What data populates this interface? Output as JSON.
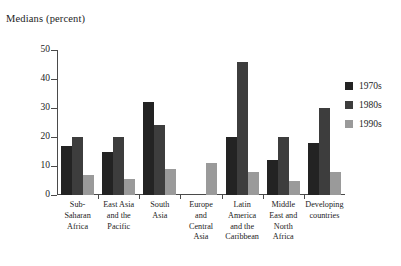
{
  "chart_data": {
    "type": "bar",
    "title": "Medians (percent)",
    "xlabel": "",
    "ylabel": "",
    "ylim": [
      0,
      50
    ],
    "yticks": [
      0,
      10,
      20,
      30,
      40,
      50
    ],
    "grid": false,
    "legend_position": "right",
    "categories": [
      "Sub-Saharan Africa",
      "East Asia and the Pacific",
      "South Asia",
      "Europe and Central Asia",
      "Latin America and the Caribbean",
      "Middle East and North Africa",
      "Developing countries"
    ],
    "category_label_lines": [
      [
        "Sub-",
        "Saharan",
        "Africa"
      ],
      [
        "East Asia",
        "and the",
        "Pacific"
      ],
      [
        "South",
        "Asia"
      ],
      [
        "Europe",
        "and",
        "Central",
        "Asia"
      ],
      [
        "Latin",
        "America",
        "and the",
        "Caribbean"
      ],
      [
        "Middle",
        "East and",
        "North",
        "Africa"
      ],
      [
        "Developing",
        "countries"
      ]
    ],
    "series": [
      {
        "name": "1970s",
        "color": "#232323",
        "values": [
          17,
          15,
          32,
          null,
          20,
          12,
          18
        ]
      },
      {
        "name": "1980s",
        "color": "#3d3d3d",
        "values": [
          20,
          20,
          24,
          null,
          46,
          20,
          30
        ]
      },
      {
        "name": "1990s",
        "color": "#9a9a9a",
        "values": [
          7,
          5.5,
          9,
          11,
          8,
          5,
          8
        ]
      }
    ]
  },
  "legend": {
    "items": [
      {
        "label": "1970s",
        "color": "#232323"
      },
      {
        "label": "1980s",
        "color": "#3d3d3d"
      },
      {
        "label": "1990s",
        "color": "#9a9a9a"
      }
    ]
  },
  "axis": {
    "tick_labels": [
      "50",
      "40",
      "30",
      "20",
      "10",
      "0"
    ]
  }
}
